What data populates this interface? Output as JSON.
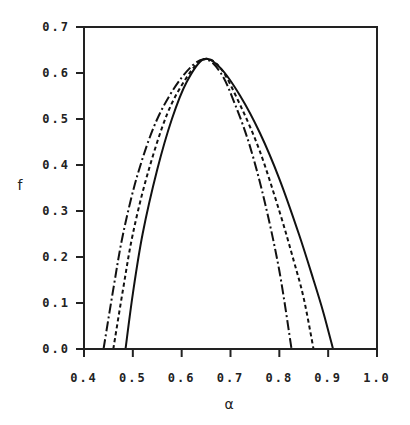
{
  "chart_data": {
    "type": "line",
    "title": "",
    "xlabel": "α",
    "ylabel": "f",
    "xlim": [
      0.4,
      1.0
    ],
    "ylim": [
      0.0,
      0.7
    ],
    "grid": false,
    "legend": null,
    "x_ticks": [
      "0.4",
      "0.5",
      "0.6",
      "0.7",
      "0.8",
      "0.9",
      "1.0"
    ],
    "y_ticks": [
      "0.0",
      "0.1",
      "0.2",
      "0.3",
      "0.4",
      "0.5",
      "0.6",
      "0.7"
    ],
    "series": [
      {
        "name": "solid",
        "style": "solid",
        "x": [
          0.485,
          0.5,
          0.52,
          0.55,
          0.58,
          0.61,
          0.645,
          0.68,
          0.72,
          0.76,
          0.8,
          0.84,
          0.87,
          0.89,
          0.91
        ],
        "y": [
          0.0,
          0.12,
          0.25,
          0.39,
          0.5,
          0.58,
          0.63,
          0.61,
          0.55,
          0.47,
          0.37,
          0.25,
          0.15,
          0.08,
          0.0
        ]
      },
      {
        "name": "dashed",
        "style": "dashed",
        "x": [
          0.46,
          0.48,
          0.5,
          0.53,
          0.57,
          0.61,
          0.645,
          0.68,
          0.72,
          0.76,
          0.8,
          0.83,
          0.85,
          0.87
        ],
        "y": [
          0.0,
          0.13,
          0.25,
          0.38,
          0.51,
          0.59,
          0.63,
          0.61,
          0.53,
          0.43,
          0.3,
          0.19,
          0.11,
          0.0
        ]
      },
      {
        "name": "dash-dot",
        "style": "dashdot",
        "x": [
          0.44,
          0.46,
          0.48,
          0.51,
          0.55,
          0.6,
          0.645,
          0.68,
          0.71,
          0.74,
          0.77,
          0.8,
          0.825
        ],
        "y": [
          0.0,
          0.13,
          0.25,
          0.38,
          0.5,
          0.59,
          0.63,
          0.6,
          0.53,
          0.44,
          0.32,
          0.17,
          0.0
        ]
      }
    ]
  }
}
